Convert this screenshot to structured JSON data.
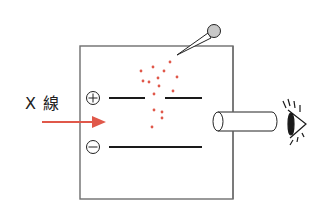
{
  "diagram": {
    "xray_label": "X 線",
    "plate_signs": {
      "top": "+",
      "bottom": "−"
    },
    "colors": {
      "line": "#1a1a1a",
      "box": "#6e6e6e",
      "arrow": "#e0584a",
      "droplet": "#e0584a",
      "bulb": "#c8c8c8"
    },
    "droplets": [
      [
        170,
        62
      ],
      [
        141,
        71
      ],
      [
        153,
        67
      ],
      [
        164,
        71
      ],
      [
        177,
        77
      ],
      [
        143,
        81
      ],
      [
        149,
        82
      ],
      [
        158,
        78
      ],
      [
        159,
        86
      ],
      [
        173,
        91
      ],
      [
        154,
        94
      ],
      [
        154,
        110
      ],
      [
        162,
        112
      ],
      [
        162,
        118
      ],
      [
        152,
        127
      ]
    ]
  }
}
